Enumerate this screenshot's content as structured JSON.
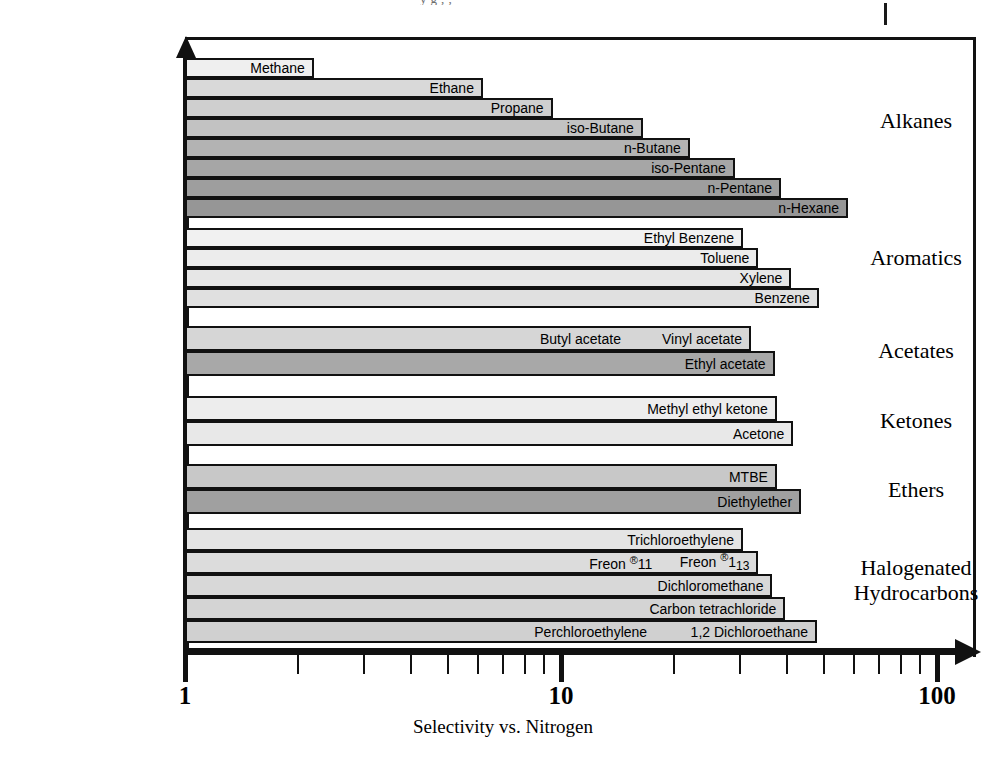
{
  "page": {
    "top_crop_text": "y  g    ,  ,",
    "x_axis_title": "Selectivity vs. Nitrogen"
  },
  "axis": {
    "tick_labels": [
      "1",
      "10",
      "100"
    ],
    "major_ticks": [
      1,
      10,
      100
    ],
    "minor_ticks": [
      2,
      3,
      4,
      5,
      6,
      7,
      8,
      9,
      20,
      30,
      40,
      50,
      60,
      70,
      80,
      90
    ],
    "scale": "log",
    "range": [
      1,
      100
    ]
  },
  "categories": [
    {
      "name": "Alkanes"
    },
    {
      "name": "Aromatics"
    },
    {
      "name": "Acetates"
    },
    {
      "name": "Ketones"
    },
    {
      "name": "Ethers"
    },
    {
      "name": "Halogenated\nHydrocarbons",
      "line1": "Halogenated",
      "line2": "Hydrocarbons"
    }
  ],
  "chart_data": {
    "type": "bar",
    "orientation": "horizontal",
    "title": "",
    "xlabel": "Selectivity vs. Nitrogen",
    "ylabel": "",
    "xscale": "log",
    "xlim": [
      1,
      100
    ],
    "xticks": [
      1,
      10,
      100
    ],
    "grid": false,
    "legend": "none",
    "groups": [
      {
        "category": "Alkanes",
        "bars": [
          {
            "label": "Methane",
            "value": 2.2,
            "color": "#efefef"
          },
          {
            "label": "Ethane",
            "value": 6.2,
            "color": "#d9d9d9"
          },
          {
            "label": "Propane",
            "value": 9.5,
            "color": "#cfcfcf"
          },
          {
            "label": "iso-Butane",
            "value": 16.5,
            "color": "#c2c2c2"
          },
          {
            "label": "n-Butane",
            "value": 22.0,
            "color": "#b3b3b3"
          },
          {
            "label": "iso-Pentane",
            "value": 29.0,
            "color": "#a6a6a6"
          },
          {
            "label": "n-Pentane",
            "value": 38.5,
            "color": "#9e9e9e"
          },
          {
            "label": "n-Hexane",
            "value": 58.0,
            "color": "#969696"
          }
        ]
      },
      {
        "category": "Aromatics",
        "bars": [
          {
            "label": "Ethyl Benzene",
            "value": 30.5,
            "color": "#f1f1f1"
          },
          {
            "label": "Toluene",
            "value": 33.5,
            "color": "#ececec"
          },
          {
            "label": "Xylene",
            "value": 41.0,
            "color": "#e6e6e6"
          },
          {
            "label": "Benzene",
            "value": 48.5,
            "color": "#e0e0e0"
          }
        ]
      },
      {
        "category": "Acetates",
        "bars": [
          {
            "label": "Vinyl acetate",
            "value": 32.0,
            "color": "#d6d6d6",
            "extra_label": "Butyl acetate"
          },
          {
            "label": "Ethyl acetate",
            "value": 37.0,
            "color": "#a8a8a8"
          }
        ]
      },
      {
        "category": "Ketones",
        "bars": [
          {
            "label": "Methyl ethyl ketone",
            "value": 37.5,
            "color": "#ededed"
          },
          {
            "label": "Acetone",
            "value": 41.5,
            "color": "#e8e8e8"
          }
        ]
      },
      {
        "category": "Ethers",
        "bars": [
          {
            "label": "MTBE",
            "value": 37.5,
            "color": "#c8c8c8"
          },
          {
            "label": "Diethylether",
            "value": 43.5,
            "color": "#a0a0a0"
          }
        ]
      },
      {
        "category": "Halogenated Hydrocarbons",
        "bars": [
          {
            "label": "Trichloroethylene",
            "value": 30.5,
            "color": "#e4e4e4"
          },
          {
            "label": "Freon ®113",
            "value": 33.5,
            "color": "#dcdcdc",
            "extra_label": "Freon ®11"
          },
          {
            "label": "Dichloromethane",
            "value": 36.5,
            "color": "#d8d8d8"
          },
          {
            "label": "Carbon tetrachloride",
            "value": 39.5,
            "color": "#d4d4d4"
          },
          {
            "label": "1,2 Dichloroethane",
            "value": 48.0,
            "color": "#d0d0d0",
            "extra_label": "Perchloroethylene"
          }
        ]
      }
    ]
  },
  "geometry": {
    "x_origin_px": 185,
    "px_per_decade": 376,
    "groups": [
      {
        "top": 58,
        "bar_h": 20,
        "count": 8
      },
      {
        "top": 228,
        "bar_h": 20,
        "count": 4
      },
      {
        "top": 326,
        "bar_h": 25,
        "count": 2
      },
      {
        "top": 396,
        "bar_h": 25,
        "count": 2
      },
      {
        "top": 464,
        "bar_h": 25,
        "count": 2
      },
      {
        "top": 528,
        "bar_h": 23,
        "count": 5
      }
    ],
    "cat_label_centers": [
      120,
      257,
      350,
      420,
      489,
      580
    ]
  }
}
